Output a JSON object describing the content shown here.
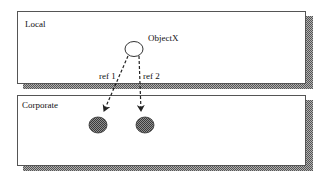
{
  "diagram": {
    "zones": [
      {
        "id": "local",
        "label": "Local"
      },
      {
        "id": "corporate",
        "label": "Corporate"
      }
    ],
    "nodes": [
      {
        "id": "objectx",
        "label": "ObjectX",
        "zone": "local",
        "style": "hollow"
      },
      {
        "id": "target1",
        "label": "",
        "zone": "corporate",
        "style": "filled"
      },
      {
        "id": "target2",
        "label": "",
        "zone": "corporate",
        "style": "filled"
      }
    ],
    "edges": [
      {
        "from": "objectx",
        "to": "target1",
        "label": "ref 1",
        "style": "dashed-arrow"
      },
      {
        "from": "objectx",
        "to": "target2",
        "label": "ref 2",
        "style": "dashed-arrow"
      }
    ],
    "colors": {
      "box_border": "#555555",
      "shadow": "#8a8a8a",
      "filled_node": "#6e6e6e"
    }
  }
}
